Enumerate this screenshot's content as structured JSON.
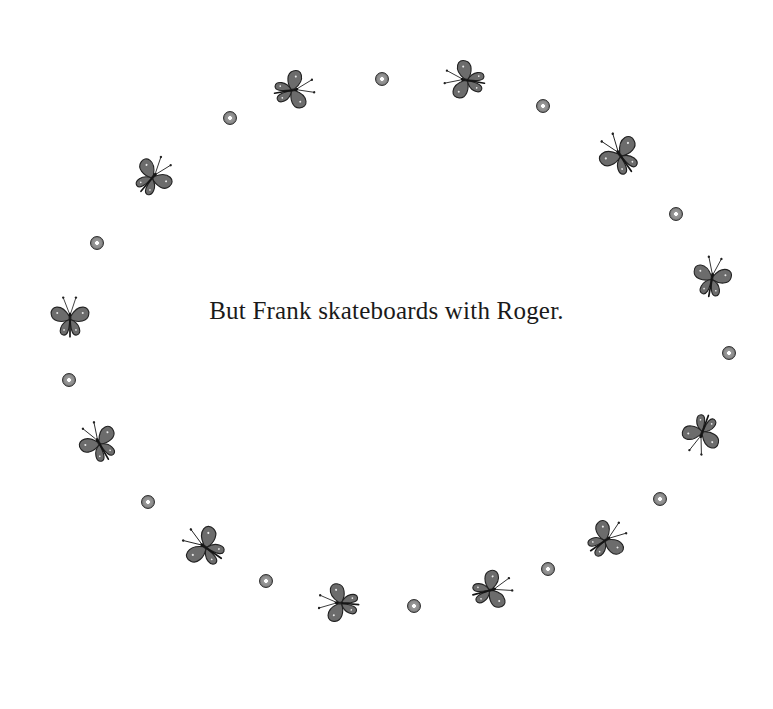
{
  "page": {
    "caption": "But Frank skateboards with Roger.",
    "background": "#ffffff"
  },
  "colors": {
    "wing_fill": "#6c6c6c",
    "wing_stroke": "#222222",
    "dot_fill": "#8a8a8a",
    "text": "#1a1a1a"
  },
  "dots": [
    {
      "x": 230,
      "y": 118
    },
    {
      "x": 382,
      "y": 79
    },
    {
      "x": 543,
      "y": 106
    },
    {
      "x": 676,
      "y": 214
    },
    {
      "x": 97,
      "y": 243
    },
    {
      "x": 729,
      "y": 353
    },
    {
      "x": 69,
      "y": 380
    },
    {
      "x": 660,
      "y": 499
    },
    {
      "x": 148,
      "y": 502
    },
    {
      "x": 548,
      "y": 569
    },
    {
      "x": 266,
      "y": 581
    },
    {
      "x": 414,
      "y": 606
    }
  ],
  "butterflies": [
    {
      "x": 293,
      "y": 90,
      "rotate": 80,
      "scale": 0.85
    },
    {
      "x": 466,
      "y": 80,
      "rotate": -80,
      "scale": 0.85
    },
    {
      "x": 620,
      "y": 155,
      "rotate": -35,
      "scale": 0.9
    },
    {
      "x": 712,
      "y": 278,
      "rotate": 10,
      "scale": 0.85
    },
    {
      "x": 153,
      "y": 177,
      "rotate": 40,
      "scale": 0.85
    },
    {
      "x": 70,
      "y": 318,
      "rotate": 0,
      "scale": 0.85
    },
    {
      "x": 99,
      "y": 443,
      "rotate": -30,
      "scale": 0.85
    },
    {
      "x": 702,
      "y": 433,
      "rotate": 200,
      "scale": 0.85
    },
    {
      "x": 606,
      "y": 540,
      "rotate": 55,
      "scale": 0.85
    },
    {
      "x": 491,
      "y": 590,
      "rotate": 75,
      "scale": 0.85
    },
    {
      "x": 340,
      "y": 603,
      "rotate": -85,
      "scale": 0.85
    },
    {
      "x": 205,
      "y": 547,
      "rotate": -55,
      "scale": 0.9
    }
  ]
}
